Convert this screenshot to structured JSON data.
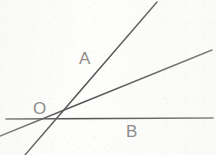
{
  "figure": {
    "background_color": "#fdfdfc",
    "stroke_color": "#3b3b3b",
    "label_color": "#8d8d8a",
    "canvas": {
      "width": 216,
      "height": 155
    },
    "vertex": {
      "name": "O",
      "x": 48,
      "y": 119
    },
    "labels": {
      "origin": "O",
      "ray_a": "A",
      "ray_b": "B"
    },
    "lines": [
      {
        "id": "line-a",
        "label": "A",
        "description": "steep rising line through O",
        "x1": 25,
        "y1": 155,
        "x2": 157,
        "y2": 2,
        "stroke_width": 1.5
      },
      {
        "id": "line-middle",
        "label": "",
        "description": "moderately rising line through O",
        "x1": 0,
        "y1": 136,
        "x2": 212,
        "y2": 50,
        "stroke_width": 1.5
      },
      {
        "id": "line-b",
        "label": "B",
        "description": "near-horizontal line through O",
        "x1": 6,
        "y1": 119,
        "x2": 213,
        "y2": 118,
        "stroke_width": 1.6
      }
    ]
  }
}
